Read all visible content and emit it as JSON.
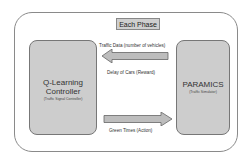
{
  "diagram": {
    "frame_label": "Each Phase",
    "nodes": [
      {
        "id": "controller",
        "title_line1": "Q-Learning",
        "title_line2": "Controller",
        "subtitle": "(Traffic Signal Controller)"
      },
      {
        "id": "simulator",
        "title": "PARAMICS",
        "subtitle": "(Traffic Simulator)"
      }
    ],
    "edges": [
      {
        "from": "simulator",
        "to": "controller",
        "label": "Traffic Data (number of vehicles)"
      },
      {
        "from": "simulator",
        "to": "controller",
        "label": "Delay of Cars (Reward)"
      },
      {
        "from": "controller",
        "to": "simulator",
        "label": "Green Times (Action)"
      }
    ],
    "colors": {
      "box_fill": "#cdcdcd",
      "arrow_fill": "#bdbdbd",
      "border": "#777777"
    }
  }
}
